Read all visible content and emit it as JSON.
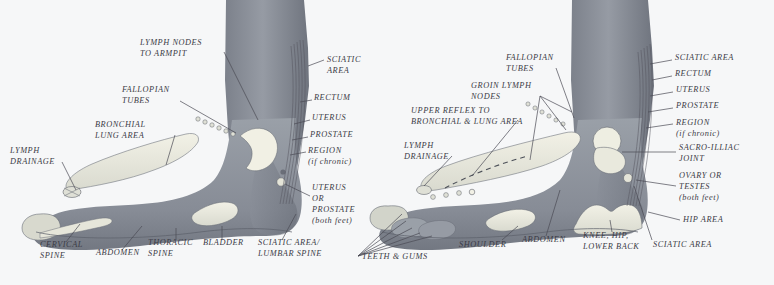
{
  "document": {
    "kind": "reflexology-foot-chart",
    "title": "Reflexology Foot Chart — Inner (Medial) Side of Both Feet",
    "background_color": "#f6f7f8",
    "skin_color": "#8e939c",
    "zone_color": "#cfd2cb",
    "label_color": "#3b3b46"
  },
  "left_panel": {
    "name": "left-foot-diagram",
    "labels": [
      {
        "id": "lymph-nodes-to-armpit",
        "lines": [
          "LYMPH NODES",
          "TO ARMPIT"
        ],
        "x": 140,
        "y": 45,
        "align": "start"
      },
      {
        "id": "sciatic-area",
        "lines": [
          "SCIATIC",
          "AREA"
        ],
        "x": 327,
        "y": 62,
        "align": "start"
      },
      {
        "id": "fallopian-tubes",
        "lines": [
          "FALLOPIAN",
          "TUBES"
        ],
        "x": 122,
        "y": 92,
        "align": "start"
      },
      {
        "id": "rectum",
        "lines": [
          "RECTUM"
        ],
        "x": 314,
        "y": 100,
        "align": "start"
      },
      {
        "id": "bronchial-lung-area",
        "lines": [
          "BRONCHIAL",
          "LUNG AREA"
        ],
        "x": 95,
        "y": 127,
        "align": "start"
      },
      {
        "id": "uterus",
        "lines": [
          "UTERUS"
        ],
        "x": 312,
        "y": 120,
        "align": "start"
      },
      {
        "id": "prostate",
        "lines": [
          "PROSTATE"
        ],
        "x": 310,
        "y": 137,
        "align": "start"
      },
      {
        "id": "region-if-chronic",
        "lines": [
          "REGION",
          "(if chronic)"
        ],
        "x": 308,
        "y": 153,
        "align": "start"
      },
      {
        "id": "lymph-drainage",
        "lines": [
          "LYMPH",
          "DRAINAGE"
        ],
        "x": 10,
        "y": 153,
        "align": "start"
      },
      {
        "id": "uterus-or-prostate-both-feet",
        "lines": [
          "UTERUS",
          "OR",
          "PROSTATE",
          "(both feet)"
        ],
        "x": 312,
        "y": 190,
        "align": "start"
      },
      {
        "id": "cervical-spine",
        "lines": [
          "CERVICAL",
          "SPINE"
        ],
        "x": 40,
        "y": 247,
        "align": "start"
      },
      {
        "id": "abdomen",
        "lines": [
          "ABDOMEN"
        ],
        "x": 96,
        "y": 255,
        "align": "start"
      },
      {
        "id": "thoracic-spine",
        "lines": [
          "THORACIC",
          "SPINE"
        ],
        "x": 148,
        "y": 245,
        "align": "start"
      },
      {
        "id": "bladder",
        "lines": [
          "BLADDER"
        ],
        "x": 203,
        "y": 245,
        "align": "start"
      },
      {
        "id": "sciatic-area-lumbar-spine",
        "lines": [
          "SCIATIC AREA/",
          "LUMBAR SPINE"
        ],
        "x": 258,
        "y": 245,
        "align": "start"
      },
      {
        "id": "teeth-and-gums",
        "lines": [
          "TEETH & GUMS"
        ],
        "x": 362,
        "y": 259,
        "align": "start"
      }
    ]
  },
  "right_panel": {
    "name": "right-foot-diagram",
    "labels": [
      {
        "id": "fallopian-tubes-r",
        "lines": [
          "FALLOPIAN",
          "TUBES"
        ],
        "x": 506,
        "y": 60,
        "align": "start"
      },
      {
        "id": "sciatic-area-r",
        "lines": [
          "SCIATIC AREA"
        ],
        "x": 675,
        "y": 60,
        "align": "start"
      },
      {
        "id": "rectum-r",
        "lines": [
          "RECTUM"
        ],
        "x": 675,
        "y": 76,
        "align": "start"
      },
      {
        "id": "groin-lymph-nodes",
        "lines": [
          "GROIN LYMPH",
          "NODES"
        ],
        "x": 471,
        "y": 88,
        "align": "start"
      },
      {
        "id": "uterus-r",
        "lines": [
          "UTERUS"
        ],
        "x": 676,
        "y": 92,
        "align": "start"
      },
      {
        "id": "prostate-r",
        "lines": [
          "PROSTATE"
        ],
        "x": 676,
        "y": 108,
        "align": "start"
      },
      {
        "id": "upper-reflex-to-bronchial-lung-area",
        "lines": [
          "UPPER REFLEX TO",
          "BRONCHIAL & LUNG AREA"
        ],
        "x": 411,
        "y": 113,
        "align": "start"
      },
      {
        "id": "region-if-chronic-r",
        "lines": [
          "REGION",
          "(if chronic)"
        ],
        "x": 676,
        "y": 125,
        "align": "start"
      },
      {
        "id": "lymph-drainage-r",
        "lines": [
          "LYMPH",
          "DRAINAGE"
        ],
        "x": 404,
        "y": 148,
        "align": "start"
      },
      {
        "id": "sacro-illiac-joint",
        "lines": [
          "SACRO-ILLIAC",
          "JOINT"
        ],
        "x": 679,
        "y": 150,
        "align": "start"
      },
      {
        "id": "ovary-or-testes-both-feet",
        "lines": [
          "OVARY OR",
          "TESTES",
          "(both feet)"
        ],
        "x": 679,
        "y": 178,
        "align": "start"
      },
      {
        "id": "hip-area",
        "lines": [
          "HIP AREA"
        ],
        "x": 683,
        "y": 222,
        "align": "start"
      },
      {
        "id": "shoulder",
        "lines": [
          "SHOULDER"
        ],
        "x": 459,
        "y": 247,
        "align": "start"
      },
      {
        "id": "abdomen-r",
        "lines": [
          "ABDOMEN"
        ],
        "x": 522,
        "y": 242,
        "align": "start"
      },
      {
        "id": "knee-hip-lower-back",
        "lines": [
          "KNEE, HIP,",
          "LOWER BACK"
        ],
        "x": 583,
        "y": 238,
        "align": "start"
      },
      {
        "id": "sciatic-area-bottom-r",
        "lines": [
          "SCIATIC AREA"
        ],
        "x": 653,
        "y": 247,
        "align": "start"
      }
    ]
  }
}
